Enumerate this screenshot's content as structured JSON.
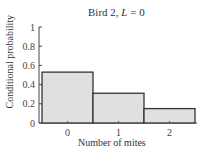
{
  "chart_data": {
    "type": "bar",
    "title": "Bird 2, L = 0",
    "title_parts": {
      "prefix": "Bird 2, ",
      "var": "L",
      "suffix": " = 0"
    },
    "xlabel": "Number of mites",
    "ylabel": "Conditional probability",
    "categories": [
      "0",
      "1",
      "2"
    ],
    "values": [
      0.53,
      0.31,
      0.15
    ],
    "ylim": [
      0,
      1
    ],
    "yticks": [
      "0",
      "0.2",
      "0.4",
      "0.6",
      "0.8",
      "1"
    ],
    "grid": false,
    "legend": null,
    "bar_fill": "#e0e0e0",
    "bar_edge": "#333333"
  }
}
